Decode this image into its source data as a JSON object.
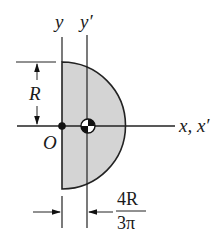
{
  "figure": {
    "shape": "semicircular area",
    "fill_color": "#d4d4d4",
    "stroke_color": "#222222",
    "background": "#ffffff"
  },
  "labels": {
    "y_axis": "y",
    "y_prime_axis": "y′",
    "x_axis": "x, x′",
    "origin": "O",
    "radius": "R",
    "centroid_offset_numerator": "4R",
    "centroid_offset_denominator": "3π"
  },
  "annotations": {
    "centroid_symbol": "centroid-marker",
    "origin_point": "origin-dot",
    "radius_dimension": "R",
    "centroid_distance_dimension": "4R/3π"
  }
}
